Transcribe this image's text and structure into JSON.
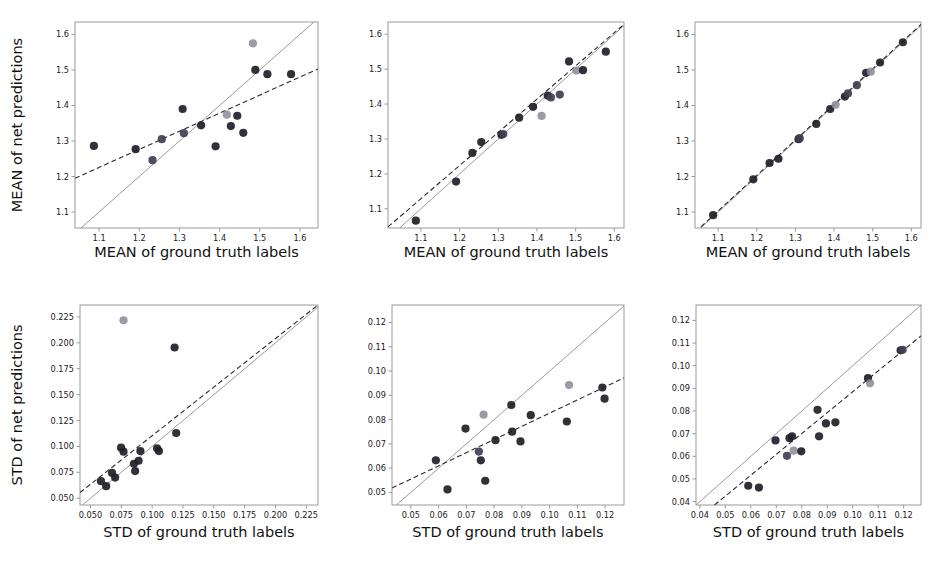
{
  "figure": {
    "layout": "2 rows x 3 columns of scatter plots",
    "background_color": "#ffffff",
    "point_colors": {
      "dark": "#1f1f28",
      "mid": "#3f3f52",
      "light": "#8a8a99"
    },
    "line_colors": {
      "identity": "#8e8e8e",
      "fit": "#2b2b2b"
    }
  },
  "axis_titles": {
    "mean_x": "MEAN of ground truth labels",
    "mean_y": "MEAN of net predictions",
    "std_x": "STD of ground truth labels",
    "std_y": "STD of net predictions"
  },
  "chart_data": [
    {
      "id": "panel-top-left",
      "type": "scatter",
      "title": "",
      "xlabel": "MEAN of ground truth labels",
      "ylabel": "MEAN of net predictions",
      "xlim": [
        1.04,
        1.645
      ],
      "ylim": [
        1.055,
        1.635
      ],
      "xticks": [
        "1.1",
        "1.2",
        "1.3",
        "1.4",
        "1.5",
        "1.6"
      ],
      "xtickvals": [
        1.1,
        1.2,
        1.3,
        1.4,
        1.5,
        1.6
      ],
      "yticks": [
        "1.1",
        "1.2",
        "1.3",
        "1.4",
        "1.5",
        "1.6"
      ],
      "ytickvals": [
        1.1,
        1.2,
        1.3,
        1.4,
        1.5,
        1.6
      ],
      "grid": false,
      "legend": "none",
      "identity_line": true,
      "fit_line": {
        "x0": 1.04,
        "y0": 1.195,
        "x1": 1.645,
        "y1": 1.503
      },
      "points": [
        {
          "x": 1.087,
          "y": 1.286,
          "shade": "dark"
        },
        {
          "x": 1.191,
          "y": 1.277,
          "shade": "dark"
        },
        {
          "x": 1.233,
          "y": 1.246,
          "shade": "mid"
        },
        {
          "x": 1.256,
          "y": 1.305,
          "shade": "mid"
        },
        {
          "x": 1.308,
          "y": 1.39,
          "shade": "dark"
        },
        {
          "x": 1.311,
          "y": 1.322,
          "shade": "mid"
        },
        {
          "x": 1.354,
          "y": 1.344,
          "shade": "dark"
        },
        {
          "x": 1.39,
          "y": 1.285,
          "shade": "dark"
        },
        {
          "x": 1.418,
          "y": 1.374,
          "shade": "light"
        },
        {
          "x": 1.428,
          "y": 1.342,
          "shade": "dark"
        },
        {
          "x": 1.444,
          "y": 1.371,
          "shade": "dark"
        },
        {
          "x": 1.459,
          "y": 1.323,
          "shade": "dark"
        },
        {
          "x": 1.483,
          "y": 1.575,
          "shade": "light"
        },
        {
          "x": 1.489,
          "y": 1.5,
          "shade": "dark"
        },
        {
          "x": 1.519,
          "y": 1.488,
          "shade": "dark"
        },
        {
          "x": 1.578,
          "y": 1.488,
          "shade": "dark"
        }
      ]
    },
    {
      "id": "panel-top-middle",
      "type": "scatter",
      "title": "",
      "xlabel": "MEAN of ground truth labels",
      "ylabel": "",
      "xlim": [
        1.015,
        1.625
      ],
      "ylim": [
        1.045,
        1.635
      ],
      "xticks": [
        "1.1",
        "1.2",
        "1.3",
        "1.4",
        "1.5",
        "1.6"
      ],
      "xtickvals": [
        1.1,
        1.2,
        1.3,
        1.4,
        1.5,
        1.6
      ],
      "yticks": [
        "1.1",
        "1.2",
        "1.3",
        "1.4",
        "1.5",
        "1.6"
      ],
      "ytickvals": [
        1.1,
        1.2,
        1.3,
        1.4,
        1.5,
        1.6
      ],
      "grid": false,
      "legend": "none",
      "identity_line": true,
      "fit_line": {
        "x0": 1.015,
        "y0": 1.048,
        "x1": 1.625,
        "y1": 1.628
      },
      "points": [
        {
          "x": 1.087,
          "y": 1.066,
          "shade": "dark"
        },
        {
          "x": 1.191,
          "y": 1.178,
          "shade": "dark"
        },
        {
          "x": 1.233,
          "y": 1.26,
          "shade": "dark"
        },
        {
          "x": 1.256,
          "y": 1.291,
          "shade": "dark"
        },
        {
          "x": 1.308,
          "y": 1.312,
          "shade": "dark"
        },
        {
          "x": 1.313,
          "y": 1.314,
          "shade": "mid"
        },
        {
          "x": 1.354,
          "y": 1.361,
          "shade": "dark"
        },
        {
          "x": 1.39,
          "y": 1.392,
          "shade": "dark"
        },
        {
          "x": 1.412,
          "y": 1.366,
          "shade": "light"
        },
        {
          "x": 1.428,
          "y": 1.424,
          "shade": "dark"
        },
        {
          "x": 1.436,
          "y": 1.419,
          "shade": "mid"
        },
        {
          "x": 1.459,
          "y": 1.427,
          "shade": "mid"
        },
        {
          "x": 1.483,
          "y": 1.522,
          "shade": "dark"
        },
        {
          "x": 1.502,
          "y": 1.496,
          "shade": "light"
        },
        {
          "x": 1.519,
          "y": 1.497,
          "shade": "dark"
        },
        {
          "x": 1.578,
          "y": 1.55,
          "shade": "dark"
        }
      ]
    },
    {
      "id": "panel-top-right",
      "type": "scatter",
      "title": "",
      "xlabel": "MEAN of ground truth labels",
      "ylabel": "",
      "xlim": [
        1.04,
        1.625
      ],
      "ylim": [
        1.055,
        1.635
      ],
      "xticks": [
        "1.1",
        "1.2",
        "1.3",
        "1.4",
        "1.5",
        "1.6"
      ],
      "xtickvals": [
        1.1,
        1.2,
        1.3,
        1.4,
        1.5,
        1.6
      ],
      "yticks": [
        "1.1",
        "1.2",
        "1.3",
        "1.4",
        "1.5",
        "1.6"
      ],
      "ytickvals": [
        1.1,
        1.2,
        1.3,
        1.4,
        1.5,
        1.6
      ],
      "grid": false,
      "legend": "none",
      "identity_line": true,
      "fit_line": {
        "x0": 1.04,
        "y0": 1.043,
        "x1": 1.625,
        "y1": 1.628
      },
      "points": [
        {
          "x": 1.087,
          "y": 1.091,
          "shade": "dark"
        },
        {
          "x": 1.191,
          "y": 1.192,
          "shade": "dark"
        },
        {
          "x": 1.233,
          "y": 1.238,
          "shade": "dark"
        },
        {
          "x": 1.256,
          "y": 1.25,
          "shade": "dark"
        },
        {
          "x": 1.308,
          "y": 1.305,
          "shade": "dark"
        },
        {
          "x": 1.311,
          "y": 1.308,
          "shade": "mid"
        },
        {
          "x": 1.354,
          "y": 1.348,
          "shade": "dark"
        },
        {
          "x": 1.39,
          "y": 1.39,
          "shade": "dark"
        },
        {
          "x": 1.404,
          "y": 1.402,
          "shade": "light"
        },
        {
          "x": 1.428,
          "y": 1.425,
          "shade": "dark"
        },
        {
          "x": 1.436,
          "y": 1.434,
          "shade": "mid"
        },
        {
          "x": 1.459,
          "y": 1.457,
          "shade": "mid"
        },
        {
          "x": 1.483,
          "y": 1.492,
          "shade": "dark"
        },
        {
          "x": 1.495,
          "y": 1.495,
          "shade": "light"
        },
        {
          "x": 1.519,
          "y": 1.521,
          "shade": "dark"
        },
        {
          "x": 1.578,
          "y": 1.578,
          "shade": "dark"
        }
      ]
    },
    {
      "id": "panel-bottom-left",
      "type": "scatter",
      "title": "",
      "xlabel": "STD of ground truth labels",
      "ylabel": "STD of net predictions",
      "xlim": [
        0.0415,
        0.2345
      ],
      "ylim": [
        0.0435,
        0.2365
      ],
      "xticks": [
        "0.050",
        "0.075",
        "0.100",
        "0.125",
        "0.150",
        "0.175",
        "0.200",
        "0.225"
      ],
      "xtickvals": [
        0.05,
        0.075,
        0.1,
        0.125,
        0.15,
        0.175,
        0.2,
        0.225
      ],
      "yticks": [
        "0.050",
        "0.075",
        "0.100",
        "0.125",
        "0.150",
        "0.175",
        "0.200",
        "0.225"
      ],
      "ytickvals": [
        0.05,
        0.075,
        0.1,
        0.125,
        0.15,
        0.175,
        0.2,
        0.225
      ],
      "grid": false,
      "legend": "none",
      "identity_line": true,
      "fit_line": {
        "x0": 0.0415,
        "y0": 0.0555,
        "x1": 0.2345,
        "y1": 0.2365
      },
      "points": [
        {
          "x": 0.0585,
          "y": 0.0665,
          "shade": "dark"
        },
        {
          "x": 0.0627,
          "y": 0.0617,
          "shade": "dark"
        },
        {
          "x": 0.0675,
          "y": 0.0745,
          "shade": "dark"
        },
        {
          "x": 0.07,
          "y": 0.07,
          "shade": "dark"
        },
        {
          "x": 0.0748,
          "y": 0.0988,
          "shade": "dark"
        },
        {
          "x": 0.0768,
          "y": 0.095,
          "shade": "dark"
        },
        {
          "x": 0.0768,
          "y": 0.2218,
          "shade": "light"
        },
        {
          "x": 0.0852,
          "y": 0.0833,
          "shade": "dark"
        },
        {
          "x": 0.0862,
          "y": 0.0762,
          "shade": "dark"
        },
        {
          "x": 0.089,
          "y": 0.0862,
          "shade": "dark"
        },
        {
          "x": 0.0905,
          "y": 0.0955,
          "shade": "dark"
        },
        {
          "x": 0.104,
          "y": 0.0982,
          "shade": "dark"
        },
        {
          "x": 0.1055,
          "y": 0.0955,
          "shade": "dark"
        },
        {
          "x": 0.1182,
          "y": 0.1955,
          "shade": "dark"
        },
        {
          "x": 0.1195,
          "y": 0.113,
          "shade": "dark"
        }
      ]
    },
    {
      "id": "panel-bottom-middle",
      "type": "scatter",
      "title": "",
      "xlabel": "STD of ground truth labels",
      "ylabel": "",
      "xlim": [
        0.0432,
        0.1268
      ],
      "ylim": [
        0.0448,
        0.1272
      ],
      "xticks": [
        "0.05",
        "0.06",
        "0.07",
        "0.08",
        "0.09",
        "0.10",
        "0.11",
        "0.12"
      ],
      "xtickvals": [
        0.05,
        0.06,
        0.07,
        0.08,
        0.09,
        0.1,
        0.11,
        0.12
      ],
      "yticks": [
        "0.05",
        "0.06",
        "0.07",
        "0.08",
        "0.09",
        "0.10",
        "0.11",
        "0.12"
      ],
      "ytickvals": [
        0.05,
        0.06,
        0.07,
        0.08,
        0.09,
        0.1,
        0.11,
        0.12
      ],
      "grid": false,
      "legend": "none",
      "identity_line": true,
      "fit_line": {
        "x0": 0.0432,
        "y0": 0.0518,
        "x1": 0.1268,
        "y1": 0.0972
      },
      "points": [
        {
          "x": 0.059,
          "y": 0.0632,
          "shade": "dark"
        },
        {
          "x": 0.0632,
          "y": 0.0512,
          "shade": "dark"
        },
        {
          "x": 0.0697,
          "y": 0.0763,
          "shade": "dark"
        },
        {
          "x": 0.0745,
          "y": 0.0668,
          "shade": "mid"
        },
        {
          "x": 0.0752,
          "y": 0.0632,
          "shade": "dark"
        },
        {
          "x": 0.0762,
          "y": 0.082,
          "shade": "light"
        },
        {
          "x": 0.0768,
          "y": 0.0548,
          "shade": "dark"
        },
        {
          "x": 0.0805,
          "y": 0.0715,
          "shade": "dark"
        },
        {
          "x": 0.0862,
          "y": 0.086,
          "shade": "dark"
        },
        {
          "x": 0.0865,
          "y": 0.075,
          "shade": "dark"
        },
        {
          "x": 0.0895,
          "y": 0.071,
          "shade": "dark"
        },
        {
          "x": 0.0932,
          "y": 0.0818,
          "shade": "dark"
        },
        {
          "x": 0.1062,
          "y": 0.0792,
          "shade": "dark"
        },
        {
          "x": 0.107,
          "y": 0.0942,
          "shade": "light"
        },
        {
          "x": 0.119,
          "y": 0.0932,
          "shade": "dark"
        },
        {
          "x": 0.1198,
          "y": 0.0886,
          "shade": "dark"
        }
      ]
    },
    {
      "id": "panel-bottom-right",
      "type": "scatter",
      "title": "",
      "xlabel": "STD of ground truth labels",
      "ylabel": "",
      "xlim": [
        0.0385,
        0.1268
      ],
      "ylim": [
        0.0385,
        0.1268
      ],
      "xticks": [
        "0.04",
        "0.05",
        "0.06",
        "0.07",
        "0.08",
        "0.09",
        "0.10",
        "0.11",
        "0.12"
      ],
      "xtickvals": [
        0.04,
        0.05,
        0.06,
        0.07,
        0.08,
        0.09,
        0.1,
        0.11,
        0.12
      ],
      "yticks": [
        "0.04",
        "0.05",
        "0.06",
        "0.07",
        "0.08",
        "0.09",
        "0.10",
        "0.11",
        "0.12"
      ],
      "ytickvals": [
        0.04,
        0.05,
        0.06,
        0.07,
        0.08,
        0.09,
        0.1,
        0.11,
        0.12
      ],
      "grid": false,
      "legend": "none",
      "identity_line": true,
      "fit_line": {
        "x0": 0.0385,
        "y0": 0.0318,
        "x1": 0.1268,
        "y1": 0.1132
      },
      "points": [
        {
          "x": 0.059,
          "y": 0.047,
          "shade": "dark"
        },
        {
          "x": 0.0632,
          "y": 0.0462,
          "shade": "dark"
        },
        {
          "x": 0.0697,
          "y": 0.067,
          "shade": "dark"
        },
        {
          "x": 0.0742,
          "y": 0.0602,
          "shade": "mid"
        },
        {
          "x": 0.0752,
          "y": 0.068,
          "shade": "dark"
        },
        {
          "x": 0.0762,
          "y": 0.0688,
          "shade": "dark"
        },
        {
          "x": 0.0768,
          "y": 0.0625,
          "shade": "light"
        },
        {
          "x": 0.0798,
          "y": 0.0622,
          "shade": "dark"
        },
        {
          "x": 0.0862,
          "y": 0.0805,
          "shade": "dark"
        },
        {
          "x": 0.0868,
          "y": 0.0688,
          "shade": "dark"
        },
        {
          "x": 0.0895,
          "y": 0.0745,
          "shade": "dark"
        },
        {
          "x": 0.0932,
          "y": 0.075,
          "shade": "dark"
        },
        {
          "x": 0.106,
          "y": 0.0945,
          "shade": "dark"
        },
        {
          "x": 0.1068,
          "y": 0.0922,
          "shade": "light"
        },
        {
          "x": 0.1188,
          "y": 0.1068,
          "shade": "dark"
        },
        {
          "x": 0.1196,
          "y": 0.107,
          "shade": "mid"
        }
      ]
    }
  ]
}
